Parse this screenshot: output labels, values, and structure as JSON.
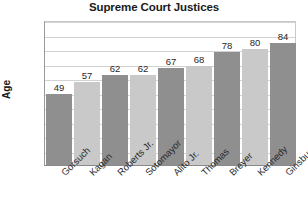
{
  "chart_data": {
    "type": "bar",
    "title": "Supreme Court Justices",
    "xlabel": "",
    "ylabel": "Age",
    "categories": [
      "Gorsuch",
      "Kagan",
      "Roberts Jr.",
      "Sotomayor",
      "Alito Jr.",
      "Thomas",
      "Breyer",
      "Kennedy",
      "Ginsburg"
    ],
    "values": [
      49,
      57,
      62,
      62,
      67,
      68,
      78,
      80,
      84
    ],
    "ylim": [
      0,
      100
    ],
    "ytick_labels": [
      "0",
      "20",
      "40",
      "60",
      "80",
      "100"
    ],
    "ytick_values": [
      0,
      20,
      40,
      60,
      80,
      100
    ],
    "gridline_values": [
      10,
      20,
      30,
      40,
      50,
      60,
      70,
      80,
      90,
      100
    ],
    "grid": true,
    "legend": "none",
    "data_labels": [
      "49",
      "57",
      "62",
      "62",
      "67",
      "68",
      "78",
      "80",
      "84"
    ],
    "bar_colors": [
      "#8f8f8f",
      "#c9c9c9",
      "#8f8f8f",
      "#c9c9c9",
      "#8f8f8f",
      "#c9c9c9",
      "#8f8f8f",
      "#c9c9c9",
      "#8f8f8f"
    ],
    "background_color": "#ffffff",
    "gridline_color": "#d2d2d2",
    "axis_color": "#8a8a8a",
    "text_color": "#1f1f1f"
  }
}
